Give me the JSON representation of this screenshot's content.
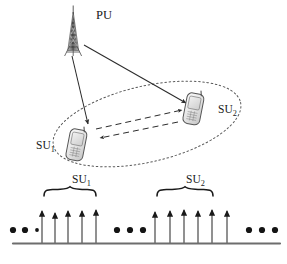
{
  "figure": {
    "name": "cognitive-radio-network-and-spectrum-allocation-diagram",
    "background_color": "#ffffff",
    "stroke_color": "#2b2b2b",
    "device_fill_color": "#e8e8e8"
  },
  "network": {
    "primary_user": {
      "icon": "cell-tower-icon",
      "label_text": "PU",
      "label_base": "PU",
      "label_sub": ""
    },
    "secondary_users": [
      {
        "icon": "mobile-phone-icon",
        "label_base": "SU",
        "label_sub": "1",
        "label_text": "SU1"
      },
      {
        "icon": "mobile-phone-icon",
        "label_base": "SU",
        "label_sub": "2",
        "label_text": "SU2"
      }
    ],
    "coverage_region": {
      "shape": "dotted-ellipse",
      "style": "dotted"
    },
    "links": [
      {
        "from": "PU",
        "to": "SU1",
        "style": "solid",
        "arrow": "single"
      },
      {
        "from": "PU",
        "to": "SU2",
        "style": "solid",
        "arrow": "single"
      },
      {
        "from": "SU1",
        "to": "SU2",
        "style": "dashed",
        "arrow": "single"
      },
      {
        "from": "SU2",
        "to": "SU1",
        "style": "dashed",
        "arrow": "single"
      }
    ]
  },
  "spectrum": {
    "axis": {
      "style": "solid-line"
    },
    "ellipsis_groups": [
      {
        "position": "left",
        "dots": 3
      },
      {
        "position": "middle",
        "dots": 3
      },
      {
        "position": "right",
        "dots": 3
      }
    ],
    "brace_groups": [
      {
        "label_base": "SU",
        "label_sub": "1",
        "label_text": "SU1",
        "carrier_count": 5
      },
      {
        "label_base": "SU",
        "label_sub": "2",
        "label_text": "SU2",
        "carrier_count": 6
      }
    ],
    "carriers_left_group_x": [
      38,
      62,
      86,
      110,
      134
    ],
    "carriers_right_group_x": [
      174,
      196,
      218,
      240,
      262,
      283
    ]
  }
}
